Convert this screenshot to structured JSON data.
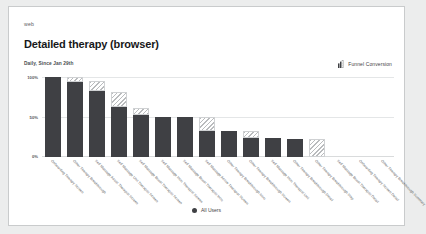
{
  "card": {
    "eyebrow": "web",
    "title": "Detailed therapy (browser)",
    "subtitle": "Daily, Since Jan 29th",
    "metric_label": "Funnel Conversion"
  },
  "legend": {
    "series_label": "All Users"
  },
  "colors": {
    "bar_solid": "#3f4044",
    "bar_hatch": "#b9bbbd",
    "grid": "#e4e6e7",
    "card_bg": "#ffffff",
    "page_bg": "#eceded",
    "border": "#c9cbcc"
  },
  "chart_data": {
    "type": "bar",
    "title": "Detailed therapy (browser)",
    "subtitle": "Daily, Since Jan 29th",
    "xlabel": "",
    "ylabel": "",
    "ylim": [
      0,
      100
    ],
    "yticks": [
      0,
      50,
      100
    ],
    "ytick_labels": [
      "0%",
      "50%",
      "100%"
    ],
    "grid": true,
    "legend_position": "bottom",
    "stacked": true,
    "categories": [
      "Onboarding Therapy Screen",
      "Other Therapy Breakthrough",
      "Self Massage Assist Therapist Screen",
      "Self Massage Unit Therapist Screen",
      "Self Massage Boost Therapist Screen",
      "Self Massage Intro Therapist Screen",
      "Self Massage Boost Therapist Intro",
      "Self Massage Active Therapist Screen",
      "Other Therapy Breakthrough Intro",
      "Other Therapy Breakthrough Screen",
      "Self Massage Intro Therapist Unit",
      "Other Therapy Breakthrough Detail",
      "Other Therapy Breakthrough Step",
      "Self Massage Boost Therapist Detail",
      "Onboarding Therapy Screen Detail",
      "Other Therapy Breakthrough Summary"
    ],
    "series": [
      {
        "name": "All Users",
        "style": "solid",
        "values": [
          100,
          94,
          82,
          62,
          53,
          50,
          50,
          33,
          33,
          24,
          24,
          23,
          0,
          0,
          0,
          0
        ]
      },
      {
        "name": "Drop-off",
        "style": "hatched",
        "values": [
          0,
          6,
          13,
          19,
          8,
          0,
          0,
          17,
          0,
          9,
          0,
          0,
          23,
          0,
          0,
          0
        ]
      }
    ]
  }
}
